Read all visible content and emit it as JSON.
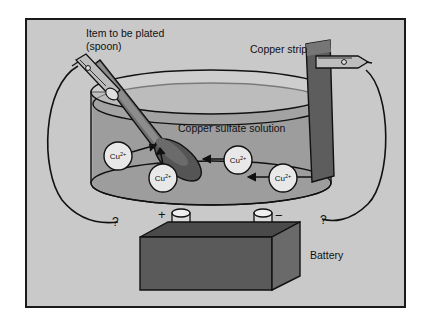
{
  "figure": {
    "background_color": "#c9c9c9",
    "border_color": "#1a1a1a"
  },
  "labels": {
    "item_to_be_plated_line1": "Item to be plated",
    "item_to_be_plated_line2": "(spoon)",
    "copper_strip": "Copper strip",
    "solution": "Copper sulfate solution",
    "battery": "Battery",
    "terminal_positive": "+",
    "terminal_negative": "−",
    "question_left": "?",
    "question_right": "?"
  },
  "ions": [
    {
      "id": "ion-1",
      "text": "Cu",
      "charge": "2+",
      "cx": 118,
      "cy": 156,
      "r": 14
    },
    {
      "id": "ion-2",
      "text": "Cu",
      "charge": "2+",
      "cx": 163,
      "cy": 178,
      "r": 14
    },
    {
      "id": "ion-3",
      "text": "Cu",
      "charge": "2+",
      "cx": 238,
      "cy": 160,
      "r": 14
    },
    {
      "id": "ion-4",
      "text": "Cu",
      "charge": "2+",
      "cx": 283,
      "cy": 178,
      "r": 14
    }
  ],
  "colors": {
    "beaker_fill": "#a8a8a8",
    "solution_fill": "#9d9d9d",
    "copper_strip": "#5d5d5d",
    "spoon_bowl": "#555555",
    "spoon_handle": "#6f6f6f",
    "battery_front": "#5a5a5a",
    "battery_top": "#4a4a4a",
    "battery_side": "#6a6a6a",
    "ion_circle": "#e8e8e8",
    "wire": "#111111",
    "clip_body": "#bdbdbd"
  }
}
